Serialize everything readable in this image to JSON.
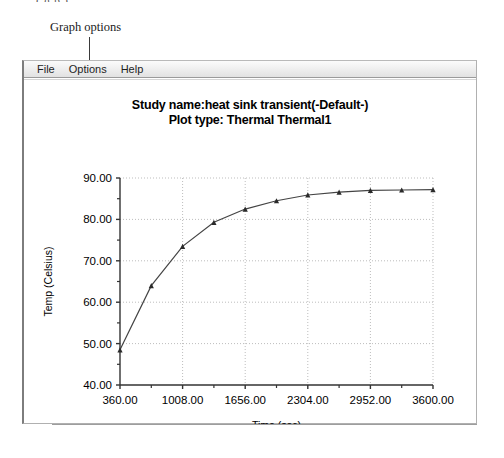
{
  "annotation": {
    "cut_text": "( g p )",
    "label": "Graph options"
  },
  "window": {
    "menubar": [
      {
        "label": "File",
        "name": "menu-file"
      },
      {
        "label": "Options",
        "name": "menu-options"
      },
      {
        "label": "Help",
        "name": "menu-help"
      }
    ]
  },
  "chart_data": {
    "type": "line",
    "title": "Study name:heat sink transient(-Default-)",
    "subtitle": "Plot type: Thermal Thermal1",
    "title_line1": "Study name:heat sink transient(-Default-)",
    "title_line2": "Plot type: Thermal Thermal1",
    "xlabel": "Time (sec)",
    "ylabel": "Temp (Celsius)",
    "xlim": [
      360,
      3600
    ],
    "ylim": [
      40,
      90
    ],
    "grid": true,
    "legend": "none",
    "marker": "triangle",
    "line_color": "#444444",
    "grid_color": "#bdbdbd",
    "xticks": [
      360,
      1008,
      1656,
      2304,
      2952,
      3600
    ],
    "xtick_labels": [
      "360.00",
      "1008.00",
      "1656.00",
      "2304.00",
      "2952.00",
      "3600.00"
    ],
    "x_minor_ticks": [
      684,
      1332,
      1980,
      2628,
      3276
    ],
    "yticks": [
      40,
      50,
      60,
      70,
      80,
      90
    ],
    "ytick_labels": [
      "40.00",
      "50.00",
      "60.00",
      "70.00",
      "80.00",
      "90.00"
    ],
    "y_minor_ticks": [
      45,
      55,
      65,
      75,
      85
    ],
    "x": [
      360,
      684,
      1008,
      1332,
      1656,
      1980,
      2304,
      2628,
      2952,
      3276,
      3600
    ],
    "values": [
      48.5,
      64.0,
      73.5,
      79.3,
      82.5,
      84.5,
      85.9,
      86.6,
      87.0,
      87.1,
      87.2
    ],
    "series": [
      {
        "name": "Thermal1",
        "values": [
          48.5,
          64.0,
          73.5,
          79.3,
          82.5,
          84.5,
          85.9,
          86.6,
          87.0,
          87.1,
          87.2
        ]
      }
    ]
  }
}
